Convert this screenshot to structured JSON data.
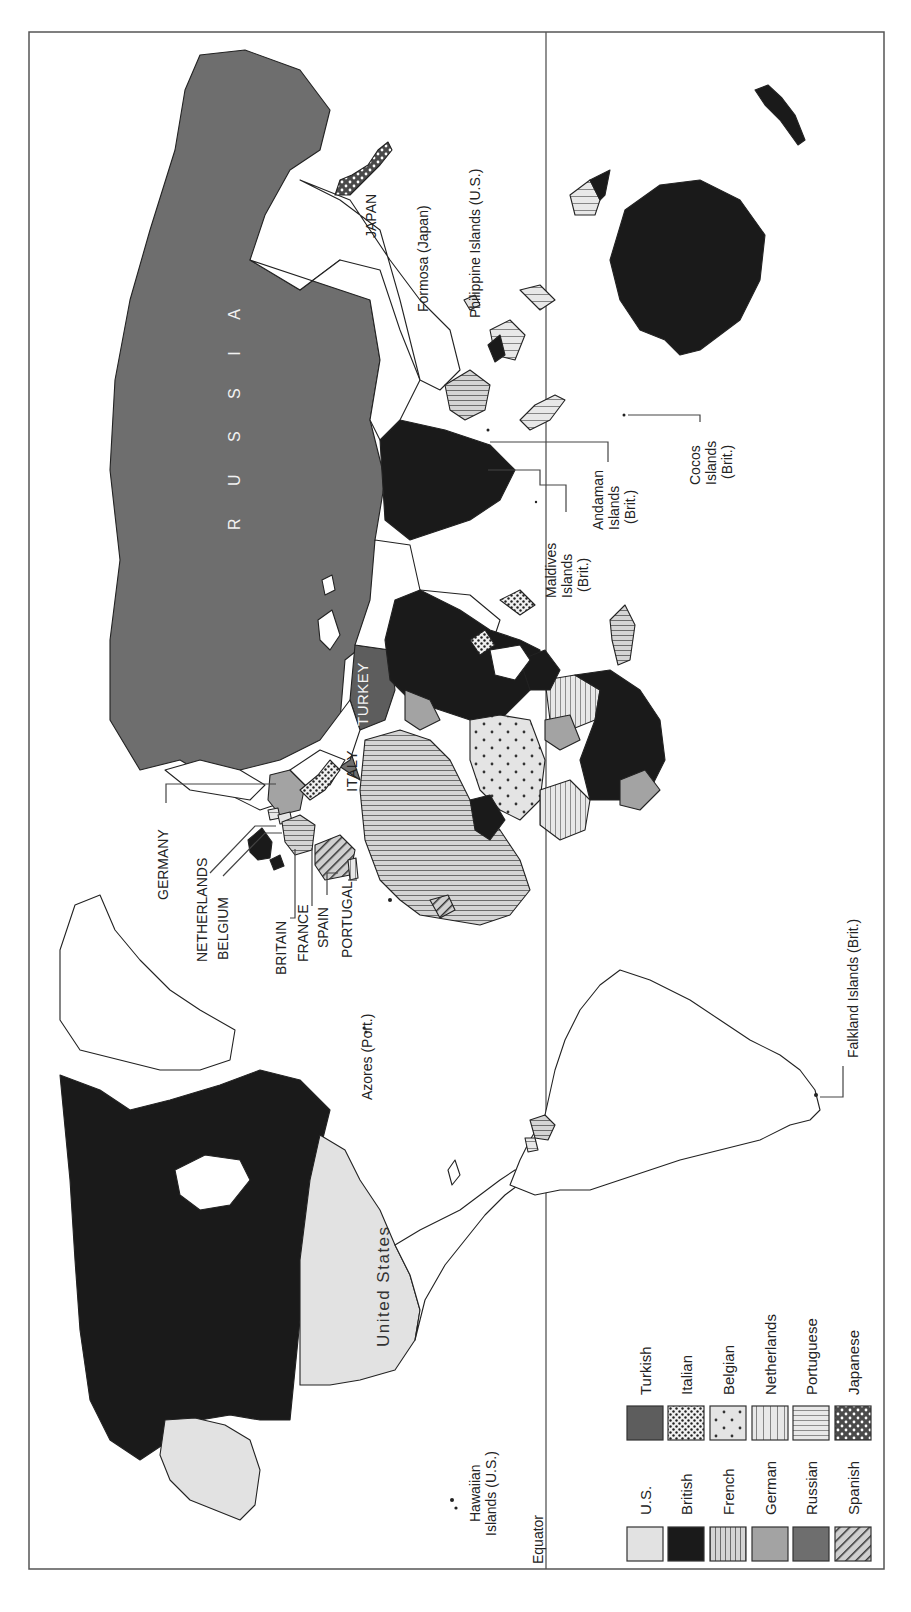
{
  "map": {
    "orientation": "rotated 90 degrees counterclockwise",
    "equator_label": "Equator",
    "regions": {
      "russia": "R U S S I A",
      "united_states": "United States",
      "turkey": "TURKEY",
      "italy": "ITALY",
      "japan": "JAPAN",
      "germany": "GERMANY",
      "netherlands": "NETHERLANDS",
      "belgium": "BELGIUM",
      "britain": "BRITAIN",
      "france": "FRANCE",
      "spain": "SPAIN",
      "portugal": "PORTUGAL"
    },
    "callouts": {
      "azores": "Azores (Port.)",
      "formosa": "Formosa (Japan)",
      "philippines": "Philippine Islands (U.S.)",
      "maldives_1": "Maldives",
      "maldives_2": "Islands",
      "maldives_3": "(Brit.)",
      "andaman_1": "Andaman",
      "andaman_2": "Islands",
      "andaman_3": "(Brit.)",
      "cocos_1": "Cocos",
      "cocos_2": "Islands",
      "cocos_3": "(Brit.)",
      "falkland": "Falkland Islands (Brit.)",
      "hawaii_1": "Hawaiian",
      "hawaii_2": "Islands (U.S.)"
    }
  },
  "legend": {
    "items": [
      {
        "label": "U.S.",
        "pattern": "solid-light-gray",
        "color": "#e2e2e2"
      },
      {
        "label": "British",
        "pattern": "solid-black",
        "color": "#1a1a1a"
      },
      {
        "label": "French",
        "pattern": "vertical-stripes",
        "color": "#9a9a9a"
      },
      {
        "label": "German",
        "pattern": "solid-medium-gray",
        "color": "#a3a3a3"
      },
      {
        "label": "Russian",
        "pattern": "solid-dark-gray",
        "color": "#6e6e6e"
      },
      {
        "label": "Spanish",
        "pattern": "diagonal-stripes",
        "color": "#5a5a5a"
      },
      {
        "label": "Turkish",
        "pattern": "solid-darker-gray",
        "color": "#5d5d5d"
      },
      {
        "label": "Italian",
        "pattern": "dense-dots",
        "color": "#ffffff"
      },
      {
        "label": "Belgian",
        "pattern": "sparse-dots",
        "color": "#e2e2e2"
      },
      {
        "label": "Netherlands",
        "pattern": "wide-vertical-stripes",
        "color": "#e2e2e2"
      },
      {
        "label": "Portuguese",
        "pattern": "horizontal-stripes",
        "color": "#e2e2e2"
      },
      {
        "label": "Japanese",
        "pattern": "white-dots-on-dark",
        "color": "#4a4a4a"
      }
    ]
  }
}
